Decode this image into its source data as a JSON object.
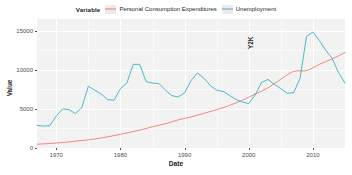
{
  "legend": {
    "title": "Variable",
    "items": [
      {
        "label": "Personal Consumption Expenditures",
        "color": "#f07a72",
        "key": "pce"
      },
      {
        "label": "Unemployment",
        "color": "#36b4c4",
        "key": "unemp"
      }
    ],
    "position": "top"
  },
  "annotation": {
    "label": "Y2K",
    "x_year": 2000
  },
  "chart_data": {
    "type": "line",
    "title": "",
    "subtitle": "",
    "xlabel": "Date",
    "ylabel": "Value",
    "xlim": [
      1967,
      2015
    ],
    "ylim": [
      0,
      16500
    ],
    "xticks": [
      1970,
      1980,
      1990,
      2000,
      2010
    ],
    "xticklabels": [
      "1970",
      "1980",
      "1990",
      "2000",
      "2010"
    ],
    "yticks": [
      0,
      5000,
      10000,
      15000
    ],
    "yticklabels": [
      "0",
      "5000",
      "10000",
      "15000"
    ],
    "grid": true,
    "legend_position": "top",
    "annotations": [
      {
        "text": "Y2K",
        "x": 2000,
        "y": 15000,
        "rotation": 90
      }
    ],
    "series": [
      {
        "name": "Personal Consumption Expenditures",
        "color": "#f07a72",
        "x": [
          1967,
          1969,
          1971,
          1973,
          1975,
          1977,
          1979,
          1981,
          1983,
          1985,
          1987,
          1989,
          1991,
          1993,
          1995,
          1997,
          1999,
          2001,
          2003,
          2005,
          2007,
          2009,
          2011,
          2013,
          2015
        ],
        "values": [
          480,
          580,
          700,
          870,
          1040,
          1280,
          1580,
          1930,
          2280,
          2720,
          3100,
          3600,
          3970,
          4430,
          4900,
          5450,
          6100,
          6900,
          7700,
          8800,
          9800,
          9900,
          10700,
          11400,
          12200
        ]
      },
      {
        "name": "Unemployment",
        "color": "#36b4c4",
        "x": [
          1967,
          1968,
          1969,
          1970,
          1971,
          1972,
          1973,
          1974,
          1975,
          1976,
          1977,
          1978,
          1979,
          1980,
          1981,
          1982,
          1983,
          1984,
          1985,
          1986,
          1987,
          1988,
          1989,
          1990,
          1991,
          1992,
          1993,
          1994,
          1995,
          1996,
          1997,
          1998,
          1999,
          2000,
          2001,
          2002,
          2003,
          2004,
          2005,
          2006,
          2007,
          2008,
          2009,
          2010,
          2011,
          2012,
          2013,
          2014,
          2015
        ],
        "values": [
          2900,
          2800,
          2850,
          4100,
          5000,
          4900,
          4400,
          5200,
          7900,
          7400,
          6900,
          6200,
          6100,
          7600,
          8300,
          10700,
          10700,
          8500,
          8300,
          8240,
          7430,
          6700,
          6530,
          7050,
          8630,
          9600,
          8940,
          7990,
          7400,
          7240,
          6740,
          6200,
          5880,
          5690,
          6800,
          8380,
          8770,
          8150,
          7590,
          7000,
          7080,
          8920,
          14270,
          14830,
          13750,
          12500,
          11460,
          9620,
          8300
        ]
      }
    ]
  }
}
